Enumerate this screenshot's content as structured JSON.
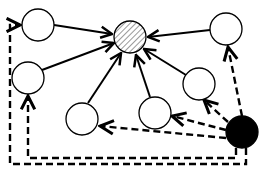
{
  "diagram": {
    "type": "directed-graph",
    "colors": {
      "background": "#ffffff",
      "stroke": "#000000",
      "node_fill": "#ffffff",
      "source_fill": "#000000",
      "hatch": "#555555"
    },
    "nodes": [
      {
        "id": "target",
        "style": "hatched",
        "cx": 130,
        "cy": 37,
        "r": 16
      },
      {
        "id": "n1",
        "style": "plain",
        "cx": 38,
        "cy": 25,
        "r": 16
      },
      {
        "id": "n2",
        "style": "plain",
        "cx": 28,
        "cy": 78,
        "r": 16
      },
      {
        "id": "n3",
        "style": "plain",
        "cx": 226,
        "cy": 29,
        "r": 16
      },
      {
        "id": "n4",
        "style": "plain",
        "cx": 199,
        "cy": 84,
        "r": 16
      },
      {
        "id": "n5",
        "style": "plain",
        "cx": 155,
        "cy": 113,
        "r": 16
      },
      {
        "id": "n6",
        "style": "plain",
        "cx": 82,
        "cy": 119,
        "r": 16
      },
      {
        "id": "source",
        "style": "filled",
        "cx": 242,
        "cy": 132,
        "r": 16
      }
    ],
    "solid_edges": [
      {
        "from": "n1",
        "to": "target"
      },
      {
        "from": "n2",
        "to": "target"
      },
      {
        "from": "n3",
        "to": "target"
      },
      {
        "from": "n4",
        "to": "target"
      },
      {
        "from": "n5",
        "to": "target"
      },
      {
        "from": "n6",
        "to": "target"
      }
    ],
    "dashed_edges": [
      {
        "from": "source",
        "to": "n3"
      },
      {
        "from": "source",
        "to": "n4"
      },
      {
        "from": "source",
        "to": "n5"
      },
      {
        "from": "source",
        "to": "n6"
      },
      {
        "from": "source",
        "to": "n2",
        "route": "bottom-left-bend"
      },
      {
        "from": "source",
        "to": "n1",
        "route": "outer-frame"
      }
    ]
  }
}
